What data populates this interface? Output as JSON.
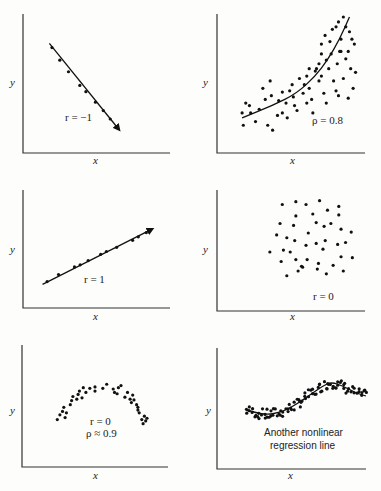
{
  "chart_data": [
    {
      "type": "scatter",
      "panel": "top-left",
      "xlabel": "x",
      "ylabel": "y",
      "annotation": "r = −1",
      "fit_line": "straight line, negative slope, with arrowhead",
      "points": [
        [
          0.08,
          0.88
        ],
        [
          0.17,
          0.76
        ],
        [
          0.27,
          0.65
        ],
        [
          0.4,
          0.52
        ],
        [
          0.47,
          0.46
        ],
        [
          0.58,
          0.36
        ],
        [
          0.67,
          0.28
        ],
        [
          0.75,
          0.2
        ],
        [
          0.82,
          0.12
        ]
      ],
      "line": [
        [
          0.05,
          0.92
        ],
        [
          0.85,
          0.1
        ]
      ]
    },
    {
      "type": "scatter",
      "panel": "top-right",
      "xlabel": "x",
      "ylabel": "y",
      "annotation": "ρ = 0.8",
      "fit_line": "convex increasing curve",
      "points": [
        [
          0.05,
          0.22
        ],
        [
          0.08,
          0.3
        ],
        [
          0.11,
          0.28
        ],
        [
          0.12,
          0.22
        ],
        [
          0.06,
          0.12
        ],
        [
          0.16,
          0.15
        ],
        [
          0.19,
          0.25
        ],
        [
          0.22,
          0.42
        ],
        [
          0.24,
          0.33
        ],
        [
          0.28,
          0.48
        ],
        [
          0.26,
          0.12
        ],
        [
          0.3,
          0.08
        ],
        [
          0.35,
          0.32
        ],
        [
          0.38,
          0.39
        ],
        [
          0.38,
          0.22
        ],
        [
          0.41,
          0.3
        ],
        [
          0.42,
          0.18
        ],
        [
          0.46,
          0.45
        ],
        [
          0.47,
          0.35
        ],
        [
          0.48,
          0.28
        ],
        [
          0.55,
          0.38
        ],
        [
          0.56,
          0.45
        ],
        [
          0.58,
          0.52
        ],
        [
          0.6,
          0.42
        ],
        [
          0.62,
          0.33
        ],
        [
          0.63,
          0.22
        ],
        [
          0.66,
          0.58
        ],
        [
          0.68,
          0.48
        ],
        [
          0.72,
          0.38
        ],
        [
          0.74,
          0.3
        ],
        [
          0.74,
          0.65
        ],
        [
          0.76,
          0.58
        ],
        [
          0.78,
          0.7
        ],
        [
          0.8,
          0.48
        ],
        [
          0.82,
          0.4
        ],
        [
          0.83,
          0.62
        ],
        [
          0.84,
          0.36
        ],
        [
          0.86,
          0.72
        ],
        [
          0.86,
          0.82
        ],
        [
          0.88,
          0.5
        ],
        [
          0.9,
          0.66
        ],
        [
          0.92,
          0.72
        ],
        [
          0.94,
          0.58
        ],
        [
          0.95,
          0.82
        ],
        [
          0.96,
          0.42
        ],
        [
          0.98,
          0.55
        ],
        [
          0.82,
          0.92
        ],
        [
          0.7,
          0.78
        ],
        [
          0.73,
          0.85
        ],
        [
          0.77,
          0.8
        ],
        [
          0.85,
          0.72
        ],
        [
          0.68,
          0.62
        ],
        [
          0.79,
          0.9
        ],
        [
          0.9,
          0.92
        ],
        [
          0.93,
          0.88
        ],
        [
          0.97,
          0.78
        ],
        [
          0.84,
          0.96
        ],
        [
          0.88,
          1.0
        ],
        [
          0.65,
          0.56
        ],
        [
          0.52,
          0.5
        ],
        [
          0.44,
          0.4
        ],
        [
          0.34,
          0.2
        ],
        [
          0.29,
          0.36
        ],
        [
          0.58,
          0.3
        ],
        [
          0.7,
          0.7
        ],
        [
          0.92,
          0.34
        ],
        [
          0.6,
          0.58
        ],
        [
          0.5,
          0.24
        ],
        [
          0.7,
          0.52
        ]
      ],
      "curve": [
        [
          0.05,
          0.18
        ],
        [
          0.3,
          0.28
        ],
        [
          0.5,
          0.38
        ],
        [
          0.65,
          0.52
        ],
        [
          0.75,
          0.65
        ],
        [
          0.85,
          0.82
        ],
        [
          0.93,
          1.0
        ]
      ]
    },
    {
      "type": "scatter",
      "panel": "middle-left",
      "xlabel": "x",
      "ylabel": "y",
      "annotation": "r = 1",
      "fit_line": "straight line, positive slope, with arrowhead",
      "points": [
        [
          0.08,
          0.12
        ],
        [
          0.18,
          0.22
        ],
        [
          0.32,
          0.33
        ],
        [
          0.37,
          0.36
        ],
        [
          0.44,
          0.42
        ],
        [
          0.55,
          0.51
        ],
        [
          0.6,
          0.55
        ],
        [
          0.69,
          0.61
        ],
        [
          0.83,
          0.71
        ],
        [
          0.88,
          0.76
        ],
        [
          0.95,
          0.82
        ]
      ],
      "line": [
        [
          0.04,
          0.08
        ],
        [
          1.0,
          0.87
        ]
      ]
    },
    {
      "type": "scatter",
      "panel": "middle-right",
      "xlabel": "x",
      "ylabel": "y",
      "annotation": "r = 0",
      "fit_line": "none",
      "points": [
        [
          0.33,
          0.9
        ],
        [
          0.45,
          0.93
        ],
        [
          0.54,
          0.9
        ],
        [
          0.66,
          0.94
        ],
        [
          0.73,
          0.84
        ],
        [
          0.83,
          0.88
        ],
        [
          0.45,
          0.78
        ],
        [
          0.6,
          0.8
        ],
        [
          0.83,
          0.79
        ],
        [
          0.31,
          0.7
        ],
        [
          0.43,
          0.68
        ],
        [
          0.63,
          0.71
        ],
        [
          0.7,
          0.67
        ],
        [
          0.76,
          0.7
        ],
        [
          0.85,
          0.64
        ],
        [
          0.56,
          0.6
        ],
        [
          0.94,
          0.61
        ],
        [
          0.28,
          0.58
        ],
        [
          0.37,
          0.55
        ],
        [
          0.44,
          0.52
        ],
        [
          0.63,
          0.49
        ],
        [
          0.71,
          0.52
        ],
        [
          0.82,
          0.48
        ],
        [
          0.89,
          0.5
        ],
        [
          0.54,
          0.47
        ],
        [
          0.69,
          0.43
        ],
        [
          0.22,
          0.4
        ],
        [
          0.34,
          0.42
        ],
        [
          0.4,
          0.4
        ],
        [
          0.85,
          0.35
        ],
        [
          0.95,
          0.34
        ],
        [
          0.32,
          0.3
        ],
        [
          0.45,
          0.32
        ],
        [
          0.55,
          0.32
        ],
        [
          0.65,
          0.28
        ],
        [
          0.5,
          0.25
        ],
        [
          0.51,
          0.24
        ],
        [
          0.47,
          0.2
        ],
        [
          0.64,
          0.22
        ],
        [
          0.78,
          0.26
        ],
        [
          0.87,
          0.2
        ],
        [
          0.37,
          0.15
        ],
        [
          0.72,
          0.17
        ]
      ]
    },
    {
      "type": "scatter",
      "panel": "bottom-left",
      "xlabel": "x",
      "ylabel": "y",
      "annotations": [
        "r = 0",
        "ρ ≈ 0.9"
      ],
      "fit_line": "none (inverted-U pattern)",
      "points": [
        [
          0.21,
          0.3
        ],
        [
          0.23,
          0.37
        ],
        [
          0.25,
          0.42
        ],
        [
          0.26,
          0.48
        ],
        [
          0.27,
          0.33
        ],
        [
          0.28,
          0.4
        ],
        [
          0.31,
          0.52
        ],
        [
          0.32,
          0.58
        ],
        [
          0.33,
          0.64
        ],
        [
          0.36,
          0.6
        ],
        [
          0.37,
          0.67
        ],
        [
          0.38,
          0.72
        ],
        [
          0.4,
          0.62
        ],
        [
          0.41,
          0.77
        ],
        [
          0.43,
          0.7
        ],
        [
          0.46,
          0.76
        ],
        [
          0.5,
          0.78
        ],
        [
          0.5,
          0.72
        ],
        [
          0.56,
          0.76
        ],
        [
          0.59,
          0.82
        ],
        [
          0.64,
          0.75
        ],
        [
          0.65,
          0.7
        ],
        [
          0.67,
          0.68
        ],
        [
          0.68,
          0.77
        ],
        [
          0.73,
          0.63
        ],
        [
          0.75,
          0.7
        ],
        [
          0.77,
          0.6
        ],
        [
          0.78,
          0.55
        ],
        [
          0.8,
          0.59
        ],
        [
          0.82,
          0.52
        ],
        [
          0.83,
          0.48
        ],
        [
          0.83,
          0.44
        ],
        [
          0.84,
          0.4
        ],
        [
          0.86,
          0.3
        ],
        [
          0.87,
          0.24
        ],
        [
          0.88,
          0.35
        ],
        [
          0.89,
          0.28
        ],
        [
          0.9,
          0.32
        ],
        [
          0.79,
          0.66
        ],
        [
          0.7,
          0.8
        ]
      ]
    },
    {
      "type": "scatter",
      "panel": "bottom-right",
      "xlabel": "x",
      "ylabel": "y",
      "annotation": "Another nonlinear regression line",
      "fit_line": "smooth wave: dip, rise to peak near x≈0.75, slight decline",
      "curve": [
        [
          0.17,
          0.5
        ],
        [
          0.3,
          0.45
        ],
        [
          0.42,
          0.48
        ],
        [
          0.52,
          0.56
        ],
        [
          0.62,
          0.66
        ],
        [
          0.7,
          0.74
        ],
        [
          0.76,
          0.78
        ],
        [
          0.84,
          0.74
        ],
        [
          0.93,
          0.67
        ],
        [
          1.0,
          0.64
        ]
      ]
    }
  ],
  "labels": {
    "x": "x",
    "y": "y",
    "r_neg1": "r = −1",
    "rho_08": "ρ = 0.8",
    "r_1": "r = 1",
    "r_0": "r = 0",
    "r_0_b": "r = 0",
    "rho_09": "ρ ≈ 0.9",
    "nonlinear_1": "Another nonlinear",
    "nonlinear_2": "regression line"
  }
}
